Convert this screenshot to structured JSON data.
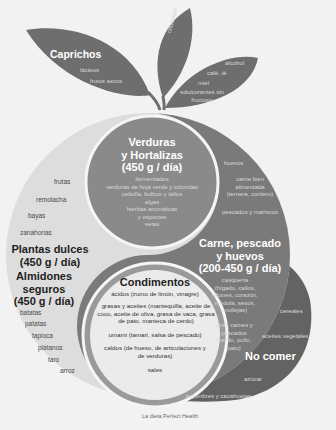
{
  "caprichos": {
    "title": "Caprichos",
    "items": [
      "lácteos",
      "frutos secos"
    ]
  },
  "chocolate_leaf": {
    "label": "chocolate"
  },
  "right_leaf": {
    "items": [
      "alcohol",
      "café, té",
      "miel",
      "edulcorantes sin fructosa"
    ]
  },
  "verduras": {
    "title_lines": [
      "Verduras",
      "y Hortalizas",
      "(450 g / día)"
    ],
    "items": [
      "fermentados",
      "verduras de hoja verde y coloridas",
      "cebolla, bulbos y tallos",
      "algas",
      "hierbas aromáticas",
      "y especias",
      "setas"
    ]
  },
  "plantas_dulces": {
    "items": [
      "frutas",
      "remolacha",
      "bayas",
      "zanahorias"
    ],
    "title_lines": [
      "Plantas dulces",
      "(450 g / día)"
    ]
  },
  "almidones": {
    "title_lines": [
      "Almidones",
      "seguros",
      "(450 g / día)"
    ],
    "items": [
      "batatas",
      "patatas",
      "tapioca",
      "plátanos",
      "taro",
      "arroz"
    ]
  },
  "condimentos": {
    "title": "Condimentos",
    "items": [
      "ácidos (zumo de limón, vinagre)",
      "grasas y aceites (mantequilla, aceite de coco, aceite de oliva, grasa de vaca, grasa de pato, manteca de cerdo)",
      "umami (tamari, salsa de pescado)",
      "caldos (de hueso, de articulaciones y de verduras)",
      "sales"
    ]
  },
  "carne": {
    "title_lines": [
      "Carne, pescado",
      "y huevos",
      "(200-450 g / día)"
    ],
    "items": [
      "huevos",
      "carne bien alimentada (ternera, cordero)",
      "pescados y mariscos",
      "casquería (hígado, callos, riñones, corazón, médula, sesos, mollejas)",
      "otras carnes y pescados (cerdo, pollo, pato)"
    ]
  },
  "no_comer": {
    "title": "No comer",
    "items": [
      "cereales",
      "aceites vegetales",
      "azúcar",
      "legumbres y cacahuetes"
    ]
  },
  "caption": "La dieta Perfect Health",
  "colors": {
    "background": "#f2f2f2",
    "dark_grey": "#6b6b6b",
    "mid_grey": "#9a9a9a",
    "light_grey": "#dcdcdc",
    "pale": "#e9e9e9",
    "white_ring": "#f7f7f7"
  }
}
